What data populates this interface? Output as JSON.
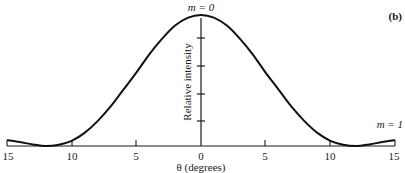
{
  "panel_label": "(b)",
  "annotations": {
    "central_max": "m = 0",
    "secondary_max": "m = 1"
  },
  "axes": {
    "xlabel": "θ (degrees)",
    "ylabel": "Relative intensity",
    "xticks": [
      "15",
      "10",
      "5",
      "0",
      "5",
      "10",
      "15"
    ]
  },
  "chart_data": {
    "type": "line",
    "title": "",
    "panel": "(b)",
    "xlabel": "θ (degrees)",
    "ylabel": "Relative intensity",
    "xlim": [
      -15,
      15
    ],
    "ylim": [
      0,
      1
    ],
    "x_tick_labels": [
      "15",
      "10",
      "5",
      "0",
      "5",
      "10",
      "15"
    ],
    "x_tick_values": [
      -15,
      -10,
      -5,
      0,
      5,
      10,
      15
    ],
    "y_ticks_unlabeled": 4,
    "grid": false,
    "legend": null,
    "annotations": [
      {
        "text": "m = 0",
        "x": 0,
        "y": 1.0
      },
      {
        "text": "m = 1",
        "x": 15,
        "y": 0.045
      }
    ],
    "series": [
      {
        "name": "Single-slit diffraction intensity",
        "x": [
          -15,
          -14,
          -13,
          -12,
          -11,
          -10,
          -9,
          -8,
          -7,
          -6,
          -5,
          -4,
          -3,
          -2,
          -1,
          0,
          1,
          2,
          3,
          4,
          5,
          6,
          7,
          8,
          9,
          10,
          11,
          12,
          13,
          14,
          15
        ],
        "values": [
          0.045,
          0.03,
          0.012,
          0.0,
          0.01,
          0.04,
          0.1,
          0.19,
          0.3,
          0.43,
          0.56,
          0.7,
          0.82,
          0.92,
          0.98,
          1.0,
          0.98,
          0.92,
          0.82,
          0.7,
          0.56,
          0.43,
          0.3,
          0.19,
          0.1,
          0.04,
          0.01,
          0.0,
          0.012,
          0.03,
          0.045
        ]
      }
    ]
  }
}
